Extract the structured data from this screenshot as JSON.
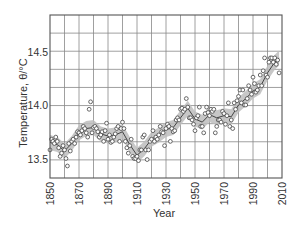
{
  "chart_data": {
    "type": "scatter",
    "title": "",
    "xlabel": "Year",
    "ylabel": "Temperature, θ/°C",
    "xlim": [
      1850,
      2010
    ],
    "ylim": [
      13.32,
      14.85
    ],
    "grid": true,
    "legend": null,
    "x_ticks": [
      "1850",
      "1870",
      "1890",
      "1910",
      "1930",
      "1950",
      "1970",
      "1990",
      "2010"
    ],
    "y_ticks": [
      "13.5",
      "14.0",
      "14.5"
    ],
    "series": [
      {
        "name": "Annual mean temperature",
        "style": "open-circles",
        "x": [
          1850,
          1851,
          1852,
          1853,
          1854,
          1855,
          1856,
          1857,
          1858,
          1859,
          1860,
          1861,
          1862,
          1863,
          1864,
          1865,
          1866,
          1867,
          1868,
          1869,
          1870,
          1871,
          1872,
          1873,
          1874,
          1875,
          1876,
          1877,
          1878,
          1879,
          1880,
          1881,
          1882,
          1883,
          1884,
          1885,
          1886,
          1887,
          1888,
          1889,
          1890,
          1891,
          1892,
          1893,
          1894,
          1895,
          1896,
          1897,
          1898,
          1899,
          1900,
          1901,
          1902,
          1903,
          1904,
          1905,
          1906,
          1907,
          1908,
          1909,
          1910,
          1911,
          1912,
          1913,
          1914,
          1915,
          1916,
          1917,
          1918,
          1919,
          1920,
          1921,
          1922,
          1923,
          1924,
          1925,
          1926,
          1927,
          1928,
          1929,
          1930,
          1931,
          1932,
          1933,
          1934,
          1935,
          1936,
          1937,
          1938,
          1939,
          1940,
          1941,
          1942,
          1943,
          1944,
          1945,
          1946,
          1947,
          1948,
          1949,
          1950,
          1951,
          1952,
          1953,
          1954,
          1955,
          1956,
          1957,
          1958,
          1959,
          1960,
          1961,
          1962,
          1963,
          1964,
          1965,
          1966,
          1967,
          1968,
          1969,
          1970,
          1971,
          1972,
          1973,
          1974,
          1975,
          1976,
          1977,
          1978,
          1979,
          1980,
          1981,
          1982,
          1983,
          1984,
          1985,
          1986,
          1987,
          1988,
          1989,
          1990,
          1991,
          1992,
          1993,
          1994,
          1995,
          1996,
          1997,
          1998,
          1999,
          2000,
          2001,
          2002,
          2003,
          2004,
          2005,
          2006,
          2007,
          2008
        ],
        "values": [
          13.58,
          13.68,
          13.66,
          13.64,
          13.7,
          13.66,
          13.6,
          13.52,
          13.55,
          13.62,
          13.58,
          13.5,
          13.43,
          13.64,
          13.57,
          13.66,
          13.68,
          13.64,
          13.7,
          13.75,
          13.74,
          13.72,
          13.76,
          13.8,
          13.78,
          13.74,
          13.7,
          13.96,
          14.03,
          13.74,
          13.79,
          13.8,
          13.78,
          13.75,
          13.7,
          13.72,
          13.75,
          13.66,
          13.76,
          13.83,
          13.68,
          13.72,
          13.65,
          13.66,
          13.7,
          13.73,
          13.78,
          13.8,
          13.66,
          13.78,
          13.84,
          13.78,
          13.66,
          13.6,
          13.55,
          13.62,
          13.68,
          13.52,
          13.5,
          13.5,
          13.52,
          13.48,
          13.58,
          13.58,
          13.7,
          13.72,
          13.58,
          13.49,
          13.58,
          13.66,
          13.68,
          13.76,
          13.66,
          13.7,
          13.68,
          13.72,
          13.8,
          13.75,
          13.74,
          13.62,
          13.78,
          13.82,
          13.8,
          13.66,
          13.78,
          13.75,
          13.76,
          13.86,
          13.88,
          13.86,
          13.96,
          13.97,
          13.94,
          13.96,
          14.06,
          13.98,
          13.88,
          13.88,
          13.86,
          13.82,
          13.76,
          13.88,
          13.9,
          13.98,
          13.8,
          13.8,
          13.74,
          13.92,
          13.98,
          13.93,
          13.9,
          13.96,
          13.94,
          13.96,
          13.74,
          13.8,
          13.86,
          13.86,
          13.84,
          13.94,
          13.92,
          13.82,
          13.9,
          14.02,
          13.8,
          13.86,
          13.78,
          14.02,
          13.96,
          14.04,
          14.08,
          14.14,
          14.02,
          14.14,
          14.0,
          14.0,
          14.06,
          14.18,
          14.14,
          14.1,
          14.26,
          14.2,
          14.12,
          14.14,
          14.18,
          14.28,
          14.18,
          14.32,
          14.44,
          14.28,
          14.26,
          14.4,
          14.44,
          14.44,
          14.4,
          14.44,
          14.38,
          14.42,
          14.3
        ]
      },
      {
        "name": "Smoothed (10-yr)",
        "style": "line-with-grey-band",
        "x": [
          1850,
          1855,
          1860,
          1865,
          1870,
          1875,
          1880,
          1885,
          1890,
          1895,
          1900,
          1905,
          1910,
          1915,
          1920,
          1925,
          1930,
          1935,
          1940,
          1945,
          1950,
          1955,
          1960,
          1965,
          1970,
          1975,
          1980,
          1985,
          1990,
          1995,
          2000,
          2005,
          2008
        ],
        "values": [
          13.65,
          13.63,
          13.57,
          13.64,
          13.74,
          13.78,
          13.79,
          13.73,
          13.71,
          13.72,
          13.75,
          13.63,
          13.53,
          13.59,
          13.68,
          13.72,
          13.77,
          13.79,
          13.88,
          13.97,
          13.87,
          13.84,
          13.91,
          13.88,
          13.9,
          13.89,
          14.0,
          14.06,
          14.13,
          14.17,
          14.3,
          14.4,
          14.44
        ]
      }
    ]
  },
  "axes": {
    "x_title": "Year",
    "y_title": "Temperature, θ/°C"
  }
}
